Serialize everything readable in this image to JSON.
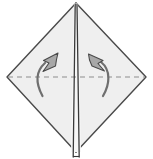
{
  "figure": {
    "kind": "origami-fold-diagram",
    "canvas": {
      "width": 153,
      "height": 159,
      "background": "#ffffff"
    }
  },
  "colors": {
    "paper_fill": "#efefef",
    "paper_fill_light": "#f7f7f7",
    "paper_outline": "#4a4a4a",
    "center_crease": "#3a3a3a",
    "fold_line_dashed": "#8d8d8d",
    "arrow_fill": "#a8a8a8",
    "arrow_outline": "#4a4a4a",
    "background": "#ffffff"
  },
  "shapes": {
    "diamond": {
      "name": "paper-diamond",
      "top": {
        "x": 76,
        "y": 3
      },
      "right": {
        "x": 146,
        "y": 77
      },
      "bottom": {
        "x": 76,
        "y": 152
      },
      "left": {
        "x": 7,
        "y": 77
      },
      "stroke_width": 1.4
    },
    "left_panel": {
      "name": "paper-left-panel",
      "points": "76,3 74,3 71,152 76,152"
    },
    "right_panel": {
      "name": "paper-right-panel",
      "points": "76,3 78,3 81,152 76,152"
    },
    "center_crease": {
      "name": "center-crease",
      "lines": [
        {
          "x1": 75.0,
          "y1": 4,
          "x2": 73.0,
          "y2": 156
        },
        {
          "x1": 77.0,
          "y1": 4,
          "x2": 79.0,
          "y2": 156
        }
      ],
      "stroke_width": 1.3
    },
    "valley_fold": {
      "name": "valley-fold-dashed-line",
      "y": 77,
      "x_start": 8,
      "x_end": 145,
      "dash": "5 4",
      "stroke_width": 1.2
    }
  },
  "arrows": [
    {
      "name": "fold-arrow-left",
      "direction": "up",
      "tail": {
        "x": 42,
        "y": 96
      },
      "head": {
        "x": 57,
        "y": 55
      },
      "path": "M 42.5 96 C 36 84 35 72 45 63",
      "head_points": "56.5,54.5 45.5,61.5 49.5,63.5 44.5,70.5 54,66.5 54.5,62"
    },
    {
      "name": "fold-arrow-right",
      "direction": "up",
      "tail": {
        "x": 103,
        "y": 96
      },
      "head": {
        "x": 95,
        "y": 55
      },
      "path": "M 103 96 C 110 84 111 70 101 62",
      "head_points": "94.5,54.5 104,62 99.5,64 105,70.5 95,66.5 94.5,61.5"
    }
  ],
  "labels": {
    "step_caption": "",
    "annotations": []
  }
}
